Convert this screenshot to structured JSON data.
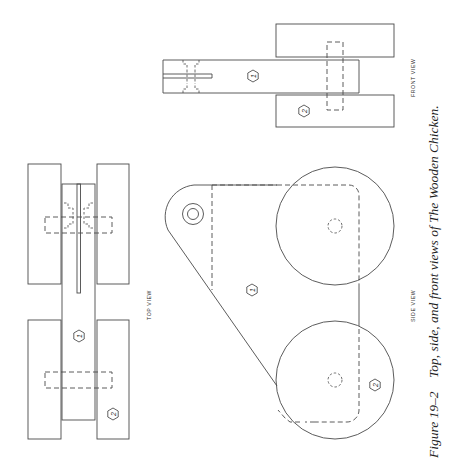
{
  "figure": {
    "number": "Figure 19–2",
    "caption": "Top, side, and front views of The Wooden Chicken.",
    "orientation": "rotated 90° counter-clockwise"
  },
  "views": {
    "top": {
      "label": "TOP VIEW",
      "parts": [
        "1",
        "2"
      ]
    },
    "side": {
      "label": "SIDE VIEW",
      "parts": [
        "1",
        "2"
      ]
    },
    "front": {
      "label": "FRONT VIEW",
      "parts": [
        "1",
        "2"
      ]
    }
  },
  "part_numbers": {
    "body": "1",
    "wheel": "2"
  },
  "colors": {
    "line": "#4a4a4a",
    "text": "#1e1e1e",
    "background": "#ffffff"
  }
}
